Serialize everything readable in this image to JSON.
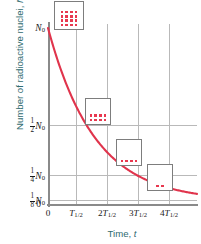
{
  "chart_data": {
    "type": "line",
    "title": "",
    "xlabel": "Time, t",
    "ylabel": "Number of radioactive nuclei, N",
    "grid": true,
    "legend_position": "none",
    "series": [
      {
        "name": "Radioactive decay",
        "color": "#e0344c",
        "formula": "N = N0 * (1/2)^(t / T_half)",
        "x": [
          0,
          0.5,
          1,
          1.5,
          2,
          2.5,
          3,
          3.5,
          4,
          4.5
        ],
        "y": [
          1,
          0.707,
          0.5,
          0.354,
          0.25,
          0.177,
          0.125,
          0.088,
          0.0625,
          0.044
        ]
      }
    ],
    "xlim": [
      0,
      4.6
    ],
    "ylim": [
      0,
      1.08
    ],
    "xtick_values": [
      0,
      1,
      2,
      3,
      4
    ],
    "xtick_labels": [
      "0",
      "T1/2",
      "2T1/2",
      "3T1/2",
      "4T1/2"
    ],
    "ytick_values": [
      0,
      0.125,
      0.25,
      0.5,
      1
    ],
    "ytick_labels": [
      "0",
      "1/8 N0",
      "1/4 N0",
      "1/2 N0",
      "N0"
    ],
    "annotations": [
      {
        "label": "sample at t = 0",
        "nuclei": 16,
        "rows": [
          4,
          4,
          4,
          4
        ]
      },
      {
        "label": "sample at t = T1/2",
        "nuclei": 8,
        "rows": [
          4,
          4
        ]
      },
      {
        "label": "sample at t = 2T1/2",
        "nuclei": 4,
        "rows": [
          4
        ]
      },
      {
        "label": "sample at t = 3T1/2",
        "nuclei": 2,
        "rows": [
          2
        ]
      }
    ]
  },
  "axes": {
    "x_title_text": "Time, ",
    "x_title_symbol": "t",
    "y_title_text": "Number of radioactive nuclei, ",
    "y_title_symbol": "N",
    "title_color": "#2f6b70"
  },
  "yticks": [
    {
      "id": "y-n0",
      "num": "",
      "den": "",
      "symbol": "N",
      "sub": "0"
    },
    {
      "id": "y-half-n0",
      "num": "1",
      "den": "2",
      "symbol": "N",
      "sub": "0"
    },
    {
      "id": "y-quarter-n0",
      "num": "1",
      "den": "4",
      "symbol": "N",
      "sub": "0"
    },
    {
      "id": "y-eighth-n0",
      "num": "1",
      "den": "8",
      "symbol": "N",
      "sub": "0"
    },
    {
      "id": "y-zero",
      "num": "",
      "den": "",
      "symbol": "0",
      "sub": ""
    }
  ],
  "xticks": [
    {
      "id": "x-zero",
      "coef": "",
      "symbol": "0",
      "sub": ""
    },
    {
      "id": "x-t1",
      "coef": "",
      "symbol": "T",
      "sub": "1/2"
    },
    {
      "id": "x-t2",
      "coef": "2",
      "symbol": "T",
      "sub": "1/2"
    },
    {
      "id": "x-t3",
      "coef": "3",
      "symbol": "T",
      "sub": "1/2"
    },
    {
      "id": "x-t4",
      "coef": "4",
      "symbol": "T",
      "sub": "1/2"
    }
  ],
  "colors": {
    "curve": "#e0344c",
    "dot": "#e8384f",
    "axis": "#8a8a8a",
    "grid": "#b9b9b9",
    "box_border": "#7d7d7d",
    "background": "#ffffff"
  }
}
